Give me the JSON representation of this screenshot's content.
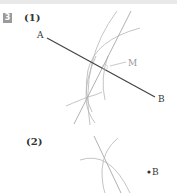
{
  "problem": {
    "number": "3",
    "parts": [
      {
        "label": "(1)",
        "points": {
          "A": "A",
          "B": "B",
          "M": "M"
        }
      },
      {
        "label": "(2)",
        "points": {
          "B": "B"
        }
      }
    ]
  },
  "colors": {
    "segment": "#444444",
    "construction": "#b0b0b0",
    "badge": "#9a9a9a",
    "topbar": "#e9e9e9"
  }
}
